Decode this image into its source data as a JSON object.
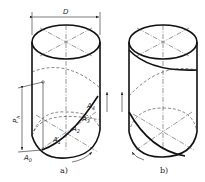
{
  "figure": {
    "panel_a": {
      "caption": "a)",
      "dimension_label": "D",
      "pitch_label": "P",
      "pitch_subscript": "h",
      "points": [
        {
          "label": "A",
          "sub": "0"
        },
        {
          "label": "A",
          "sub": "1"
        },
        {
          "label": "A",
          "sub": "2"
        },
        {
          "label": "A",
          "sub": "3"
        },
        {
          "label": "A",
          "sub": "4"
        }
      ]
    },
    "panel_b": {
      "caption": "b)"
    }
  }
}
